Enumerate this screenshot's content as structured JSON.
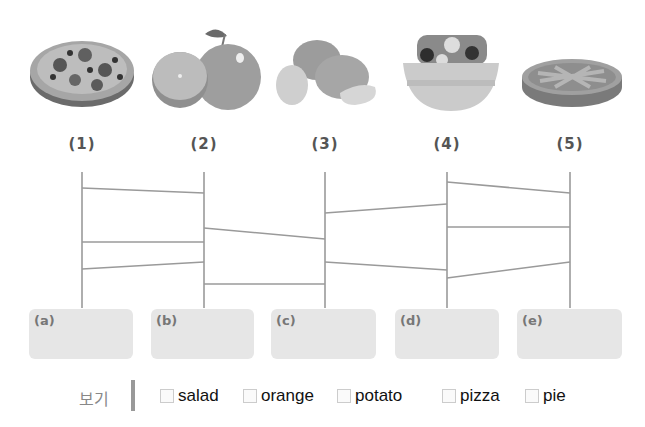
{
  "items": [
    {
      "number": "(1)",
      "food_icon": "pizza-icon",
      "x": 82
    },
    {
      "number": "(2)",
      "food_icon": "orange-icon",
      "x": 204
    },
    {
      "number": "(3)",
      "food_icon": "potato-icon",
      "x": 325
    },
    {
      "number": "(4)",
      "food_icon": "salad-icon",
      "x": 447
    },
    {
      "number": "(5)",
      "food_icon": "pie-icon",
      "x": 570
    }
  ],
  "answer_boxes": [
    {
      "label": "(a)",
      "value": ""
    },
    {
      "label": "(b)",
      "value": ""
    },
    {
      "label": "(c)",
      "value": ""
    },
    {
      "label": "(d)",
      "value": ""
    },
    {
      "label": "(e)",
      "value": ""
    }
  ],
  "ladder": {
    "vertical_top": 172,
    "vertical_bottom": 308,
    "rungs": [
      {
        "x1": 82,
        "y1": 188,
        "x2": 204,
        "y2": 193
      },
      {
        "x1": 82,
        "y1": 242,
        "x2": 204,
        "y2": 242
      },
      {
        "x1": 82,
        "y1": 269,
        "x2": 204,
        "y2": 262
      },
      {
        "x1": 204,
        "y1": 228,
        "x2": 325,
        "y2": 239
      },
      {
        "x1": 204,
        "y1": 284,
        "x2": 325,
        "y2": 284
      },
      {
        "x1": 325,
        "y1": 213,
        "x2": 447,
        "y2": 204
      },
      {
        "x1": 325,
        "y1": 262,
        "x2": 447,
        "y2": 270
      },
      {
        "x1": 447,
        "y1": 182,
        "x2": 570,
        "y2": 193
      },
      {
        "x1": 447,
        "y1": 227,
        "x2": 570,
        "y2": 227
      },
      {
        "x1": 447,
        "y1": 278,
        "x2": 570,
        "y2": 262
      }
    ],
    "line_color": "#9a9a9a"
  },
  "word_bank": {
    "label": "보기",
    "options": [
      "salad",
      "orange",
      "potato",
      "pizza",
      "pie"
    ]
  }
}
